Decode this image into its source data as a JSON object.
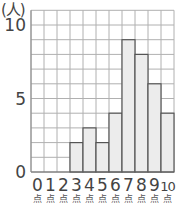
{
  "chart_data": {
    "type": "bar",
    "title": "",
    "ylabel": "(人)",
    "xlabel": "点",
    "categories": [
      "0",
      "1",
      "2",
      "3",
      "4",
      "5",
      "6",
      "7",
      "8",
      "9",
      "10"
    ],
    "values": [
      0,
      0,
      0,
      2,
      3,
      2,
      4,
      9,
      8,
      6,
      4
    ],
    "y_ticks": [
      "0",
      "5",
      "10"
    ],
    "ylim": [
      0,
      11
    ],
    "grid": true,
    "legend": null,
    "x_unit_label": "点",
    "colors": {
      "bar_fill": "#ececec",
      "bar_stroke": "#555555",
      "grid": "#b0b0b0",
      "axis_text": "#444444"
    }
  },
  "labels": {
    "y_unit": "(人)",
    "x_unit": "点"
  }
}
